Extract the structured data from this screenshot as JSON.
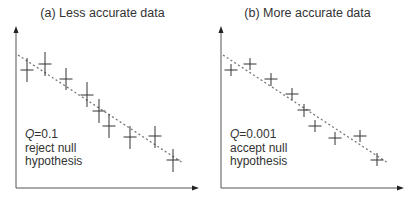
{
  "chart_data": [
    {
      "type": "scatter",
      "title": "(a) Less accurate data",
      "xlabel": "",
      "ylabel": "",
      "grid": false,
      "legend": null,
      "annotation": {
        "q_label": "Q",
        "q_value": "=0.1",
        "line1": "reject null",
        "line2": "hypothesis"
      },
      "fit_line": {
        "style": "dashed",
        "x": [
          0,
          10
        ],
        "y": [
          10,
          0
        ]
      },
      "points": [
        {
          "x": 0.5,
          "y": 8.5,
          "err": 1.5
        },
        {
          "x": 1.6,
          "y": 8.9,
          "err": 1.5
        },
        {
          "x": 2.9,
          "y": 8.0,
          "err": 1.4
        },
        {
          "x": 4.2,
          "y": 7.0,
          "err": 1.6
        },
        {
          "x": 4.9,
          "y": 6.0,
          "err": 1.5
        },
        {
          "x": 5.5,
          "y": 5.0,
          "err": 1.5
        },
        {
          "x": 6.8,
          "y": 4.3,
          "err": 1.5
        },
        {
          "x": 8.3,
          "y": 4.4,
          "err": 1.4
        },
        {
          "x": 9.4,
          "y": 2.9,
          "err": 1.5
        }
      ],
      "pixel_points": [
        [
          27,
          70,
          58,
          82
        ],
        [
          45,
          64,
          52,
          76
        ],
        [
          66,
          79,
          68,
          90
        ],
        [
          87,
          95,
          82,
          107
        ],
        [
          99,
          111,
          99,
          123
        ],
        [
          109,
          126,
          114,
          138
        ],
        [
          130,
          137,
          126,
          149
        ],
        [
          155,
          136,
          126,
          148
        ],
        [
          173,
          160,
          149,
          172
        ]
      ],
      "pixel_line": [
        18,
        55,
        183,
        163
      ]
    },
    {
      "type": "scatter",
      "title": "(b) More accurate data",
      "xlabel": "",
      "ylabel": "",
      "grid": false,
      "legend": null,
      "annotation": {
        "q_label": "Q",
        "q_value": "=0.001",
        "line1": "accept null",
        "line2": "hypothesis"
      },
      "fit_line": {
        "style": "dashed",
        "x": [
          0,
          10
        ],
        "y": [
          10,
          0
        ]
      },
      "points": [
        {
          "x": 0.5,
          "y": 8.5,
          "err": 0.8
        },
        {
          "x": 1.6,
          "y": 8.9,
          "err": 0.8
        },
        {
          "x": 2.9,
          "y": 8.0,
          "err": 0.8
        },
        {
          "x": 4.2,
          "y": 7.0,
          "err": 0.8
        },
        {
          "x": 4.9,
          "y": 6.0,
          "err": 0.8
        },
        {
          "x": 5.5,
          "y": 5.0,
          "err": 0.8
        },
        {
          "x": 6.8,
          "y": 4.3,
          "err": 0.8
        },
        {
          "x": 8.3,
          "y": 4.4,
          "err": 0.8
        },
        {
          "x": 9.4,
          "y": 2.9,
          "err": 0.8
        }
      ],
      "pixel_points": [
        [
          26,
          70,
          64,
          76
        ],
        [
          45,
          64,
          58,
          70
        ],
        [
          66,
          79,
          73,
          86
        ],
        [
          87,
          94,
          88,
          100
        ],
        [
          99,
          110,
          104,
          117
        ],
        [
          110,
          126,
          120,
          132
        ],
        [
          130,
          138,
          132,
          145
        ],
        [
          155,
          136,
          130,
          142
        ],
        [
          172,
          160,
          153,
          166
        ]
      ],
      "pixel_line": [
        18,
        55,
        183,
        163
      ]
    }
  ],
  "panels": [
    {
      "title": "(a) Less accurate data",
      "q_label": "Q",
      "q_value": "=0.1",
      "line1": "reject null",
      "line2": "hypothesis"
    },
    {
      "title": "(b) More accurate data",
      "q_label": "Q",
      "q_value": "=0.001",
      "line1": "accept null",
      "line2": "hypothesis"
    }
  ],
  "colors": {
    "ink": "#333333",
    "axis": "#555555",
    "fit": "#777777"
  }
}
